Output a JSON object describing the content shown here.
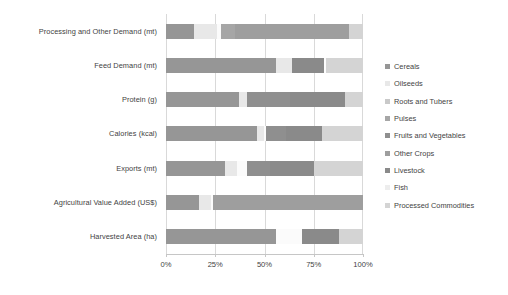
{
  "chart_data": {
    "type": "bar",
    "orientation": "horizontal",
    "stacked": true,
    "normalized": true,
    "title": "",
    "xlabel": "",
    "ylabel": "",
    "xlim": [
      0,
      100
    ],
    "xticks": [
      0,
      25,
      50,
      75,
      100
    ],
    "xtick_labels": [
      "0%",
      "25%",
      "50%",
      "75%",
      "100%"
    ],
    "grid": true,
    "legend_position": "right",
    "categories": [
      "Processing and Other Demand (mt)",
      "Feed Demand (mt)",
      "Protein (g)",
      "Calories (kcal)",
      "Exports (mt)",
      "Agricultural Value Added (US$)",
      "Harvested Area (ha)"
    ],
    "series": [
      {
        "name": "Cereals",
        "color": "#969696",
        "values": [
          14,
          56,
          37,
          46,
          30,
          17,
          56
        ]
      },
      {
        "name": "Oilseeds",
        "color": "#e8e8e8",
        "values": [
          12,
          8,
          4,
          4,
          6,
          6,
          0
        ]
      },
      {
        "name": "Roots and Tubers",
        "color": "#fbfbfb",
        "values": [
          2,
          0,
          0,
          1,
          5,
          1,
          13
        ]
      },
      {
        "name": "Pulses",
        "color": "#a6a6a6",
        "values": [
          7,
          0,
          0,
          0,
          0,
          0,
          0
        ]
      },
      {
        "name": "Fruits and Vegetables",
        "color": "#8f8f8f",
        "values": [
          0,
          0,
          22,
          10,
          12,
          0,
          0
        ]
      },
      {
        "name": "Other Crops",
        "color": "#9e9e9e",
        "values": [
          58,
          0,
          0,
          0,
          0,
          76,
          0
        ]
      },
      {
        "name": "Livestock",
        "color": "#8a8a8a",
        "values": [
          0,
          16,
          28,
          18,
          22,
          0,
          19
        ]
      },
      {
        "name": "Fish",
        "color": "#fcfcfc",
        "values": [
          0,
          1,
          0,
          0,
          0,
          0,
          0
        ]
      },
      {
        "name": "Processed Commodities",
        "color": "#d4d4d4",
        "values": [
          7,
          19,
          9,
          21,
          25,
          0,
          12
        ]
      }
    ]
  },
  "legend": {
    "items": [
      {
        "label": "Cereals",
        "color": "#969696"
      },
      {
        "label": "Oilseeds",
        "color": "#e8e8e8"
      },
      {
        "label": "Roots and Tubers",
        "color": "#c9c9c9"
      },
      {
        "label": "Pulses",
        "color": "#a6a6a6"
      },
      {
        "label": "Fruits and Vegetables",
        "color": "#8f8f8f"
      },
      {
        "label": "Other Crops",
        "color": "#9e9e9e"
      },
      {
        "label": "Livestock",
        "color": "#8a8a8a"
      },
      {
        "label": "Fish",
        "color": "#ededed"
      },
      {
        "label": "Processed Commodities",
        "color": "#d4d4d4"
      }
    ]
  }
}
